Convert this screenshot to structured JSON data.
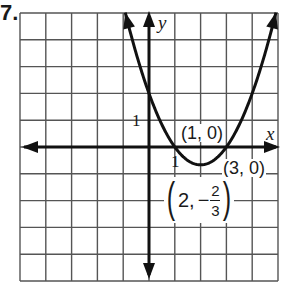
{
  "problem": {
    "number": "7."
  },
  "graph": {
    "grid": {
      "columns": 10,
      "rows": 10,
      "color": "#555555"
    },
    "axes": {
      "x_label": "x",
      "y_label": "y",
      "x_tick_label": "1",
      "y_tick_label": "1",
      "color": "#111111"
    },
    "curve": {
      "equation": "y = (2/3)(x - 1)(x - 3)",
      "color": "#111111"
    },
    "labels": {
      "x_intercept_1": "(1, 0)",
      "x_intercept_2": "(3, 0)",
      "vertex_x": "2,",
      "vertex_sign": "−",
      "vertex_num": "2",
      "vertex_den": "3",
      "paren_open": "(",
      "paren_close": ")"
    }
  },
  "chart_data": {
    "type": "line",
    "title": "",
    "xlabel": "x",
    "ylabel": "y",
    "xlim": [
      -5,
      5
    ],
    "ylim": [
      -5,
      5
    ],
    "grid": true,
    "series": [
      {
        "name": "parabola",
        "function": "y = (2/3)(x-1)(x-3)",
        "points": [
          [
            1,
            0
          ],
          [
            2,
            -0.667
          ],
          [
            3,
            0
          ]
        ]
      }
    ],
    "annotations": [
      "(1, 0)",
      "(3, 0)",
      "(2, -2/3)"
    ],
    "tick_labels": {
      "x": [
        "1"
      ],
      "y": [
        "1"
      ]
    }
  }
}
